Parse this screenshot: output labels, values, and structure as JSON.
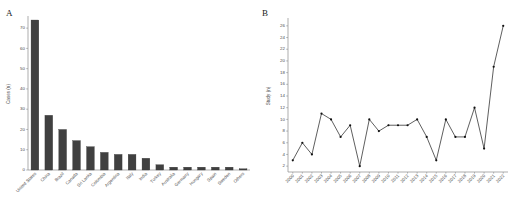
{
  "figure": {
    "panel_a_letter": "A",
    "panel_b_letter": "B"
  },
  "chart_data": [
    {
      "id": "panel-a",
      "type": "bar",
      "title": "",
      "xlabel": "",
      "ylabel": "Cases (n)",
      "ylim": [
        0,
        75
      ],
      "yticks": [
        0,
        10,
        20,
        30,
        40,
        50,
        60,
        70
      ],
      "grid": false,
      "legend": "none",
      "categories": [
        "United States",
        "China",
        "Brazil",
        "Canada",
        "Sri Lanka",
        "Colombia",
        "Argentina",
        "Italy",
        "India",
        "Turkey",
        "Australia",
        "Germany",
        "Hungary",
        "Spain",
        "Sweden",
        "Others"
      ],
      "values": [
        74,
        27,
        20,
        14.5,
        11.5,
        8.7,
        7.7,
        7.7,
        5.8,
        2.6,
        1.4,
        1.4,
        1.4,
        1.4,
        1.4,
        0.6
      ]
    },
    {
      "id": "panel-b",
      "type": "line",
      "title": "",
      "xlabel": "",
      "ylabel": "Study (n)",
      "ylim": [
        1,
        27
      ],
      "yticks": [
        2,
        4,
        6,
        8,
        10,
        12,
        14,
        16,
        18,
        20,
        22,
        24,
        26
      ],
      "grid": false,
      "legend": "none",
      "marker": "filled-circle",
      "x": [
        "2000",
        "2001",
        "2002",
        "2003",
        "2004",
        "2005",
        "2006",
        "2007",
        "2008",
        "2009",
        "2010",
        "2011",
        "2012",
        "2013",
        "2014",
        "2015",
        "2016",
        "2017",
        "2018",
        "2019",
        "2020",
        "2021",
        "2022"
      ],
      "values": [
        3,
        6,
        4,
        11,
        10,
        7,
        9,
        2,
        10,
        8,
        9,
        9,
        9,
        10,
        7,
        3,
        10,
        7,
        7,
        12,
        5,
        19,
        26
      ]
    }
  ]
}
